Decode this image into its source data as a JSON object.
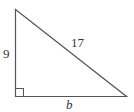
{
  "diagram": {
    "type": "right-triangle",
    "labels": {
      "vertical_leg": "9",
      "hypotenuse": "17",
      "horizontal_leg": "b"
    },
    "right_angle_marker": true,
    "stroke_color": "#555555"
  }
}
